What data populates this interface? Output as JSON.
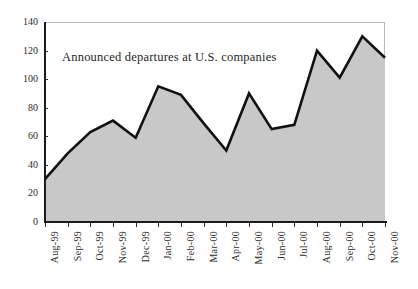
{
  "chart_data": {
    "type": "area",
    "title": "Announced departures at U.S. companies",
    "xlabel": "",
    "ylabel": "",
    "ylim": [
      0,
      140
    ],
    "yticks": [
      0,
      20,
      40,
      60,
      80,
      100,
      120,
      140
    ],
    "grid": false,
    "legend": null,
    "categories": [
      "Aug-99",
      "Sep-99",
      "Oct-99",
      "Nov-99",
      "Dec-99",
      "Jan-00",
      "Feb-00",
      "Mar-00",
      "Apr-00",
      "May-00",
      "Jun-00",
      "Jul-00",
      "Aug-00",
      "Sep-00",
      "Oct-00",
      "Nov-00"
    ],
    "values": [
      30,
      48,
      63,
      71,
      59,
      95,
      89,
      69,
      50,
      90,
      65,
      68,
      120,
      101,
      130,
      115
    ],
    "series": [
      {
        "name": "Announced departures",
        "values": [
          30,
          48,
          63,
          71,
          59,
          95,
          89,
          69,
          50,
          90,
          65,
          68,
          120,
          101,
          130,
          115
        ]
      }
    ],
    "colors": {
      "line": "#111111",
      "fill": "#c8c8c8",
      "axis": "#1a1a1a",
      "text": "#2b2b2b",
      "frame": "#b9b9b9",
      "background": "#ffffff"
    }
  }
}
